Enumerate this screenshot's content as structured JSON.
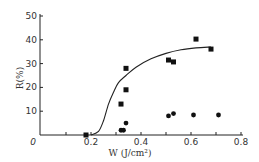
{
  "chart_data": {
    "type": "scatter",
    "title": "",
    "xlabel": "W (J/cm²)",
    "ylabel": "R(%)",
    "xlim": [
      0,
      0.8
    ],
    "ylim": [
      0,
      50
    ],
    "x_ticks": [
      0,
      0.1,
      0.2,
      0.3,
      0.4,
      0.5,
      0.6,
      0.7,
      0.8
    ],
    "x_tick_labels": [
      "0",
      "0.2",
      "0.4",
      "0.6",
      "0.8"
    ],
    "x_tick_label_values": [
      0,
      0.2,
      0.4,
      0.6,
      0.8
    ],
    "y_ticks": [
      0,
      10,
      20,
      30,
      40,
      50
    ],
    "y_tick_labels": [
      "10",
      "20",
      "30",
      "40",
      "50"
    ],
    "y_tick_label_values": [
      10,
      20,
      30,
      40,
      50
    ],
    "grid": false,
    "legend": null,
    "series": [
      {
        "name": "squares",
        "marker": "square",
        "color": "#111111",
        "points": [
          {
            "x": 0.18,
            "y": 0
          },
          {
            "x": 0.32,
            "y": 13
          },
          {
            "x": 0.34,
            "y": 19
          },
          {
            "x": 0.34,
            "y": 28
          },
          {
            "x": 0.51,
            "y": 31.5
          },
          {
            "x": 0.53,
            "y": 30.7
          },
          {
            "x": 0.62,
            "y": 40.3
          },
          {
            "x": 0.68,
            "y": 36.1
          }
        ]
      },
      {
        "name": "circles",
        "marker": "circle",
        "color": "#111111",
        "points": [
          {
            "x": 0.32,
            "y": 2
          },
          {
            "x": 0.33,
            "y": 2
          },
          {
            "x": 0.34,
            "y": 5
          },
          {
            "x": 0.51,
            "y": 8
          },
          {
            "x": 0.53,
            "y": 9
          },
          {
            "x": 0.61,
            "y": 8.4
          },
          {
            "x": 0.71,
            "y": 8.4
          }
        ]
      },
      {
        "name": "fit-curve",
        "type": "line",
        "color": "#222222",
        "points": [
          {
            "x": 0.2,
            "y": 0
          },
          {
            "x": 0.23,
            "y": 1.5
          },
          {
            "x": 0.25,
            "y": 6
          },
          {
            "x": 0.27,
            "y": 13
          },
          {
            "x": 0.29,
            "y": 18
          },
          {
            "x": 0.31,
            "y": 22
          },
          {
            "x": 0.34,
            "y": 25
          },
          {
            "x": 0.38,
            "y": 28.5
          },
          {
            "x": 0.44,
            "y": 32
          },
          {
            "x": 0.5,
            "y": 34.3
          },
          {
            "x": 0.56,
            "y": 35.8
          },
          {
            "x": 0.62,
            "y": 36.6
          },
          {
            "x": 0.68,
            "y": 37
          }
        ]
      }
    ]
  }
}
